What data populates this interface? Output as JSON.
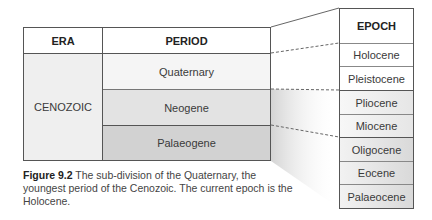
{
  "left_table": {
    "headers": {
      "era": "ERA",
      "period": "PERIOD"
    },
    "era": "CENOZOIC",
    "periods": [
      "Quaternary",
      "Neogene",
      "Palaeogene"
    ]
  },
  "right_table": {
    "header": "EPOCH",
    "epochs": [
      "Holocene",
      "Pleistocene",
      "Pliocene",
      "Miocene",
      "Oligocene",
      "Eocene",
      "Palaeocene"
    ]
  },
  "caption": {
    "label": "Figure 9.2",
    "text": " The sub-division of the Quaternary, the youngest period of the Cenozoic. The current epoch is the Holocene."
  }
}
